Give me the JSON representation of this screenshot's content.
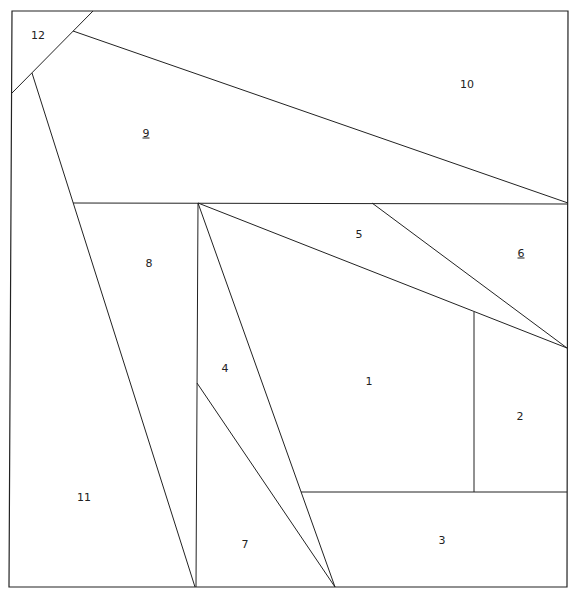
{
  "diagram": {
    "stroke_color": "#222222",
    "background": "#ffffff",
    "border": [
      [
        12,
        11
      ],
      [
        568,
        11
      ],
      [
        567,
        587
      ],
      [
        9,
        587
      ]
    ],
    "lines": [
      [
        [
          93,
          11
        ],
        [
          12,
          93
        ]
      ],
      [
        [
          73,
          31
        ],
        [
          568,
          203
        ]
      ],
      [
        [
          32,
          73
        ],
        [
          195,
          587
        ]
      ],
      [
        [
          73,
          203
        ],
        [
          568,
          204
        ]
      ],
      [
        [
          198,
          203
        ],
        [
          196,
          587
        ]
      ],
      [
        [
          198,
          203
        ],
        [
          567,
          348
        ]
      ],
      [
        [
          372,
          203
        ],
        [
          567,
          348
        ]
      ],
      [
        [
          198,
          203
        ],
        [
          335,
          587
        ]
      ],
      [
        [
          197,
          383
        ],
        [
          335,
          587
        ]
      ],
      [
        [
          474,
          312
        ],
        [
          474,
          492
        ]
      ],
      [
        [
          301,
          492
        ],
        [
          567,
          492
        ]
      ]
    ],
    "pieces": [
      {
        "id": "1",
        "label": "1",
        "x": 369,
        "y": 381,
        "underline": false
      },
      {
        "id": "2",
        "label": "2",
        "x": 520,
        "y": 416,
        "underline": false
      },
      {
        "id": "3",
        "label": "3",
        "x": 442,
        "y": 540,
        "underline": false
      },
      {
        "id": "4",
        "label": "4",
        "x": 225,
        "y": 368,
        "underline": false
      },
      {
        "id": "5",
        "label": "5",
        "x": 359,
        "y": 234,
        "underline": false
      },
      {
        "id": "6",
        "label": "6",
        "x": 521,
        "y": 253,
        "underline": true
      },
      {
        "id": "7",
        "label": "7",
        "x": 245,
        "y": 544,
        "underline": false
      },
      {
        "id": "8",
        "label": "8",
        "x": 149,
        "y": 263,
        "underline": false
      },
      {
        "id": "9",
        "label": "9",
        "x": 146,
        "y": 133,
        "underline": true
      },
      {
        "id": "10",
        "label": "10",
        "x": 467,
        "y": 84,
        "underline": false
      },
      {
        "id": "11",
        "label": "11",
        "x": 84,
        "y": 497,
        "underline": false
      },
      {
        "id": "12",
        "label": "12",
        "x": 38,
        "y": 35,
        "underline": false
      }
    ]
  }
}
